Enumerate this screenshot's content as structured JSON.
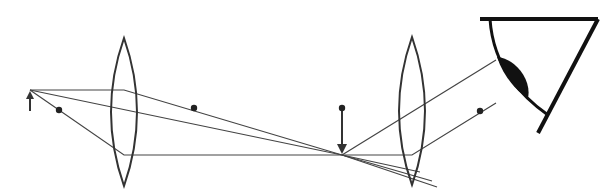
{
  "diagram": {
    "colors": {
      "background": "#ffffff",
      "line": "#333333",
      "ray": "#444444",
      "eye": "#111111"
    },
    "object_arrow": {
      "x": 30,
      "y_base": 111,
      "y_tip": 91,
      "direction": "up"
    },
    "objective_lens": {
      "cx": 124,
      "top": 38,
      "bottom": 186,
      "half_width": 13
    },
    "eyepiece_lens": {
      "cx": 412,
      "top": 37,
      "bottom": 185,
      "half_width": 13
    },
    "focal_points": [
      {
        "name": "objective-front-focus",
        "x": 59,
        "y": 110
      },
      {
        "name": "objective-back-focus",
        "x": 194,
        "y": 108
      },
      {
        "name": "eyepiece-front-focus",
        "x": 342,
        "y": 108
      },
      {
        "name": "eyepiece-back-focus",
        "x": 480,
        "y": 111
      }
    ],
    "image_arrow": {
      "x": 342,
      "y_base": 108,
      "y_tip": 154,
      "direction": "down"
    },
    "rays": [
      {
        "name": "parallel-ray",
        "points": [
          [
            30,
            90
          ],
          [
            124,
            90
          ],
          [
            342,
            155
          ],
          [
            432,
            181
          ]
        ]
      },
      {
        "name": "chief-ray",
        "points": [
          [
            30,
            90
          ],
          [
            342,
            155
          ],
          [
            420,
            172
          ]
        ]
      },
      {
        "name": "focal-ray",
        "points": [
          [
            30,
            90
          ],
          [
            124,
            155
          ],
          [
            342,
            155
          ],
          [
            412,
            155
          ],
          [
            496,
            103
          ]
        ]
      },
      {
        "name": "exit-ray-upper",
        "points": [
          [
            342,
            155
          ],
          [
            496,
            60
          ]
        ]
      },
      {
        "name": "lower-converging-ray",
        "points": [
          [
            342,
            155
          ],
          [
            437,
            187
          ]
        ]
      }
    ],
    "eye": {
      "top_bar": [
        [
          480,
          19
        ],
        [
          598,
          19
        ]
      ],
      "right_edge": [
        [
          598,
          19
        ],
        [
          538,
          133
        ]
      ],
      "cornea_curve": "M490,19 C492,50 505,85 548,115",
      "lens_blob": "M497,57 C515,58 532,80 528,98 C515,90 503,75 497,57 Z"
    }
  }
}
